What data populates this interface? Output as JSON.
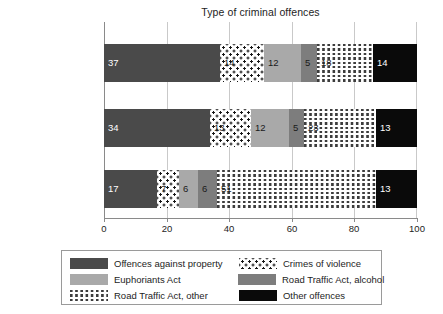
{
  "chart_data": {
    "type": "bar",
    "orientation": "horizontal",
    "stacked": true,
    "normalized_percent": true,
    "title": "Type of criminal offences",
    "xlabel": "",
    "ylabel": "",
    "xlim": [
      0,
      100
    ],
    "xticks": [
      0,
      20,
      40,
      60,
      80,
      100
    ],
    "grid": true,
    "grid_axis": "x",
    "legend_position": "bottom",
    "categories": [
      "Diagnosed Adults",
      "Prescribed Adults",
      "Population"
    ],
    "series": [
      {
        "name": "Offences against property",
        "color": "#4a4a4a",
        "pattern": "solid-dark-gray",
        "values": [
          37,
          34,
          17
        ]
      },
      {
        "name": "Crimes of violence",
        "color": "#161616",
        "pattern": "dotted",
        "values": [
          14,
          13,
          7
        ]
      },
      {
        "name": "Euphoriants Act",
        "color": "#a9a9a9",
        "pattern": "solid-light-gray",
        "values": [
          12,
          12,
          6
        ]
      },
      {
        "name": "Road Traffic Act, alcohol",
        "color": "#7d7d7d",
        "pattern": "solid-medium-gray",
        "values": [
          5,
          5,
          6
        ]
      },
      {
        "name": "Road Traffic Act, other",
        "color": "#3c3c3c",
        "pattern": "dashed-hatch",
        "values": [
          18,
          23,
          51
        ]
      },
      {
        "name": "Other offences",
        "color": "#0a0a0a",
        "pattern": "solid-black",
        "values": [
          14,
          13,
          13
        ]
      }
    ]
  },
  "legend": {
    "entries": [
      {
        "label": "Offences against property",
        "swatch": "swatch-property"
      },
      {
        "label": "Crimes of violence",
        "swatch": "swatch-violence"
      },
      {
        "label": "Euphoriants Act",
        "swatch": "swatch-euphoriants"
      },
      {
        "label": "Road Traffic Act, alcohol",
        "swatch": "swatch-alcohol"
      },
      {
        "label": "Road Traffic Act, other",
        "swatch": "swatch-rtother"
      },
      {
        "label": "Other offences",
        "swatch": "swatch-other"
      }
    ]
  }
}
